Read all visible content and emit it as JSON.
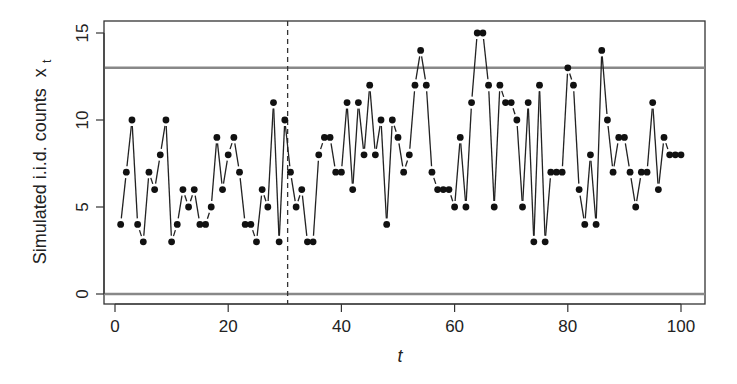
{
  "chart_data": {
    "type": "scatter",
    "title": "",
    "xlabel": "t",
    "ylabel": "Simulated i.i.d. counts x_t",
    "ylabel_main": "Simulated i.i.d. counts",
    "ylabel_var": "x",
    "ylabel_sub": "t",
    "xlim": [
      -3,
      104
    ],
    "ylim": [
      -0.6,
      15.6
    ],
    "x_ticks": [
      0,
      20,
      40,
      60,
      80,
      100
    ],
    "y_ticks": [
      0,
      5,
      10,
      15
    ],
    "grid": false,
    "legend": null,
    "style": "points connected by short gapped line segments (R type='b')",
    "reference_lines": {
      "horizontal": [
        {
          "y": 0,
          "label": "lower control limit",
          "color": "#888888"
        },
        {
          "y": 13,
          "label": "upper control limit",
          "color": "#888888"
        }
      ],
      "vertical_dashed": {
        "x": 30.5,
        "color": "#333333"
      }
    },
    "x": [
      1,
      2,
      3,
      4,
      5,
      6,
      7,
      8,
      9,
      10,
      11,
      12,
      13,
      14,
      15,
      16,
      17,
      18,
      19,
      20,
      21,
      22,
      23,
      24,
      25,
      26,
      27,
      28,
      29,
      30,
      31,
      32,
      33,
      34,
      35,
      36,
      37,
      38,
      39,
      40,
      41,
      42,
      43,
      44,
      45,
      46,
      47,
      48,
      49,
      50,
      51,
      52,
      53,
      54,
      55,
      56,
      57,
      58,
      59,
      60,
      61,
      62,
      63,
      64,
      65,
      66,
      67,
      68,
      69,
      70,
      71,
      72,
      73,
      74,
      75,
      76,
      77,
      78,
      79,
      80,
      81,
      82,
      83,
      84,
      85,
      86,
      87,
      88,
      89,
      90,
      91,
      92,
      93,
      94,
      95,
      96,
      97,
      98,
      99,
      100
    ],
    "values": [
      4,
      7,
      10,
      4,
      3,
      7,
      6,
      8,
      10,
      3,
      4,
      6,
      5,
      6,
      4,
      4,
      5,
      9,
      6,
      8,
      9,
      7,
      4,
      4,
      3,
      6,
      5,
      11,
      3,
      10,
      7,
      5,
      6,
      3,
      3,
      8,
      9,
      9,
      7,
      7,
      11,
      6,
      11,
      8,
      12,
      8,
      10,
      4,
      10,
      9,
      7,
      8,
      12,
      14,
      12,
      7,
      6,
      6,
      6,
      5,
      9,
      5,
      11,
      15,
      15,
      12,
      5,
      12,
      11,
      11,
      10,
      5,
      11,
      3,
      12,
      3,
      7,
      7,
      7,
      13,
      12,
      6,
      4,
      8,
      4,
      14,
      10,
      7,
      9,
      9,
      7,
      5,
      7,
      7,
      11,
      6,
      9,
      8,
      8,
      8
    ]
  }
}
